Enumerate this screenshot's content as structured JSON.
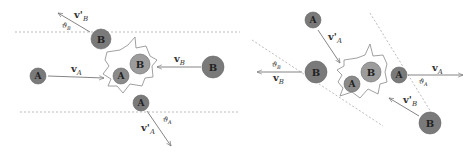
{
  "figure": {
    "panels": [
      {
        "id": "left",
        "description": "Collision with incoming particles A and B, outgoing A' and B'",
        "balls": [
          {
            "label": "B",
            "role": "outgoing-B"
          },
          {
            "label": "A",
            "role": "incoming-A"
          },
          {
            "label": "A",
            "role": "collision-A"
          },
          {
            "label": "B",
            "role": "collision-B"
          },
          {
            "label": "B",
            "role": "incoming-B"
          },
          {
            "label": "A",
            "role": "outgoing-A"
          }
        ],
        "vectors": [
          {
            "label": "v'",
            "sub": "B",
            "role": "outgoing-B-velocity"
          },
          {
            "label": "v",
            "sub": "A",
            "role": "incoming-A-velocity"
          },
          {
            "label": "v",
            "sub": "B",
            "role": "incoming-B-velocity"
          },
          {
            "label": "v'",
            "sub": "A",
            "role": "outgoing-A-velocity"
          }
        ],
        "angles": [
          {
            "label": "ϑ",
            "sub": "B"
          },
          {
            "label": "ϑ",
            "sub": "A"
          }
        ]
      },
      {
        "id": "right",
        "description": "Reverse collision: primed velocities incoming, unprimed outgoing",
        "balls": [
          {
            "label": "A",
            "role": "incoming-A"
          },
          {
            "label": "B",
            "role": "outgoing-B"
          },
          {
            "label": "A",
            "role": "collision-A"
          },
          {
            "label": "B",
            "role": "collision-B"
          },
          {
            "label": "A",
            "role": "outgoing-A"
          },
          {
            "label": "B",
            "role": "incoming-B"
          }
        ],
        "vectors": [
          {
            "label": "v'",
            "sub": "A",
            "role": "incoming-A-velocity"
          },
          {
            "label": "v",
            "sub": "B",
            "role": "outgoing-B-velocity"
          },
          {
            "label": "v",
            "sub": "A",
            "role": "outgoing-A-velocity"
          },
          {
            "label": "v'",
            "sub": "B",
            "role": "incoming-B-velocity"
          }
        ],
        "angles": [
          {
            "label": "ϑ",
            "sub": "B"
          },
          {
            "label": "ϑ",
            "sub": "A"
          }
        ]
      }
    ],
    "colors": {
      "ball_dark": "#7a7a7a",
      "ball_light": "#9a9a9a",
      "ball_stroke": "#5a5a5a",
      "line": "#888888",
      "dashed": "#999999",
      "text": "#333333"
    }
  }
}
